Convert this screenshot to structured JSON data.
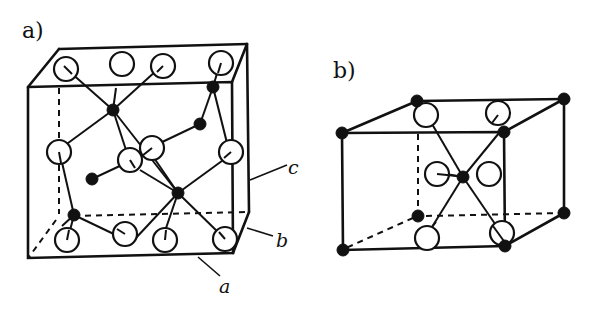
{
  "figure": {
    "panels": [
      {
        "id": "a",
        "label": "a)",
        "description": "Unit cell with open (large) and filled (small) atoms connected by bonds",
        "axis_labels": {
          "a": "a",
          "b": "b",
          "c": "c"
        },
        "open_atom_count": 12,
        "filled_atom_count": 6
      },
      {
        "id": "b",
        "label": "b)",
        "description": "Unit cell with filled atoms at corners and center, open atoms in octahedral coordination",
        "open_atom_count": 6,
        "filled_atom_count": 9
      }
    ],
    "colors": {
      "line": "#111111",
      "open_atom_fill": "#ffffff",
      "filled_atom": "#111111",
      "background": "#ffffff"
    }
  }
}
